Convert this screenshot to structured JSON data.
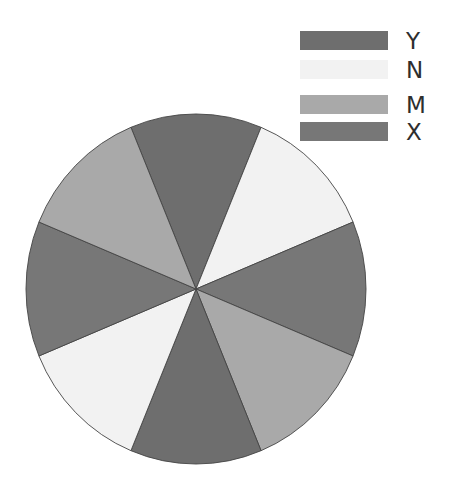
{
  "chart_data": {
    "type": "pie",
    "title": "",
    "slices": [
      {
        "label": "Y",
        "value": 12.5,
        "color": "#6e6e6e"
      },
      {
        "label": "N",
        "value": 12.5,
        "color": "#f2f2f2"
      },
      {
        "label": "X",
        "value": 12.5,
        "color": "#777777"
      },
      {
        "label": "M",
        "value": 12.5,
        "color": "#a9a9a9"
      },
      {
        "label": "Y",
        "value": 12.5,
        "color": "#6e6e6e"
      },
      {
        "label": "N",
        "value": 12.5,
        "color": "#f2f2f2"
      },
      {
        "label": "X",
        "value": 12.5,
        "color": "#777777"
      },
      {
        "label": "M",
        "value": 12.5,
        "color": "#a9a9a9"
      }
    ],
    "categories": [
      "Y",
      "N",
      "M",
      "X"
    ],
    "values": [
      25,
      25,
      25,
      25
    ],
    "start_angle_deg": -112.5,
    "direction": "clockwise",
    "legend": {
      "position": "upper right",
      "entries": [
        {
          "label": "Y",
          "color": "#6e6e6e"
        },
        {
          "label": "N",
          "color": "#f2f2f2"
        },
        {
          "label": "M",
          "color": "#a9a9a9"
        },
        {
          "label": "X",
          "color": "#777777"
        }
      ]
    },
    "edge_color": "#444444"
  }
}
